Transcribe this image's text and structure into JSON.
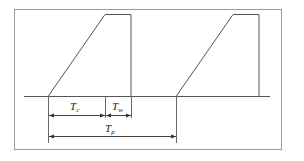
{
  "diagram": {
    "title": "",
    "colors": {
      "stroke": "#555555",
      "frame": "#9a9a9a",
      "text": "#222222"
    },
    "frame": {
      "x": 14,
      "y": 9,
      "width": 268,
      "height": 141
    },
    "baseline": {
      "y": 96,
      "x1": 24,
      "x2": 270
    },
    "cycles": [
      {
        "start_x": 48,
        "peak_x": 105,
        "top_end_x": 131,
        "top_y": 14
      },
      {
        "start_x": 176,
        "peak_x": 233,
        "top_end_x": 259,
        "top_y": 14
      }
    ],
    "labels": {
      "tc": {
        "main": "T",
        "sub": "c",
        "meaning": "rise segment"
      },
      "tw": {
        "main": "T",
        "sub": "w",
        "meaning": "hold segment"
      },
      "tp": {
        "main": "T",
        "sub": "p",
        "meaning": "period"
      }
    },
    "dimensions": [
      {
        "name": "tc",
        "x1": 48,
        "x2": 105,
        "y": 115
      },
      {
        "name": "tw",
        "x1": 105,
        "x2": 131,
        "y": 115
      },
      {
        "name": "tp",
        "x1": 48,
        "x2": 176,
        "y": 136
      }
    ]
  }
}
